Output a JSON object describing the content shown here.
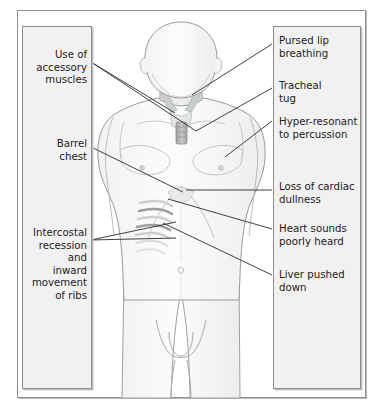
{
  "figure": {
    "frame_color": "#8e8e8e",
    "panel_fill": "#f1f1f1",
    "panel_border": "#8a8a8a",
    "leader_line_color": "#2b2b2b",
    "body_outline_color": "#9a9a9a",
    "body_fill": "#fbfbfb"
  },
  "left_panel": {
    "align": "right",
    "labels": [
      {
        "id": "accessory-muscles",
        "text": "Use of\naccessory\nmuscles",
        "top": 48,
        "lines": 3
      },
      {
        "id": "barrel-chest",
        "text": "Barrel\nchest",
        "top": 137,
        "lines": 2
      },
      {
        "id": "intercostal-recession",
        "text": "Intercostal\nrecession\nand\ninward\nmovement\nof ribs",
        "top": 226,
        "lines": 6
      }
    ]
  },
  "right_panel": {
    "align": "left",
    "labels": [
      {
        "id": "pursed-lip-breathing",
        "text": "Pursed lip\nbreathing",
        "top": 34,
        "lines": 2
      },
      {
        "id": "tracheal-tug",
        "text": "Tracheal\ntug",
        "top": 79,
        "lines": 2
      },
      {
        "id": "hyper-resonant",
        "text": "Hyper-resonant\nto percussion",
        "top": 115,
        "lines": 2
      },
      {
        "id": "loss-cardiac-dullness",
        "text": "Loss of cardiac\ndullness",
        "top": 180,
        "lines": 2
      },
      {
        "id": "heart-sounds",
        "text": "Heart sounds\npoorly heard",
        "top": 222,
        "lines": 2
      },
      {
        "id": "liver-pushed-down",
        "text": "Liver pushed\ndown",
        "top": 268,
        "lines": 2
      }
    ]
  },
  "leaders": {
    "accessory_muscles_a": {
      "from": [
        91,
        62
      ],
      "to": [
        175,
        113
      ]
    },
    "accessory_muscles_b": {
      "from": [
        91,
        62
      ],
      "to": [
        196,
        131
      ]
    },
    "barrel_chest": {
      "from": [
        91,
        147
      ],
      "to": [
        183,
        192
      ]
    },
    "intercostal_a": {
      "from": [
        91,
        240
      ],
      "to": [
        176,
        222
      ]
    },
    "intercostal_b": {
      "from": [
        91,
        240
      ],
      "to": [
        176,
        238
      ]
    },
    "pursed_lip": {
      "from": [
        272,
        44
      ],
      "to": [
        192,
        95
      ]
    },
    "tracheal_tug": {
      "from": [
        272,
        88
      ],
      "to": [
        196,
        131
      ]
    },
    "hyper_resonant": {
      "from": [
        272,
        121
      ],
      "to": [
        225,
        157
      ]
    },
    "loss_cardiac": {
      "from": [
        272,
        190
      ],
      "to": [
        186,
        190
      ]
    },
    "heart_sounds": {
      "from": [
        272,
        229
      ],
      "to": [
        168,
        199
      ]
    },
    "liver_pushed": {
      "from": [
        272,
        275
      ],
      "to": [
        163,
        223
      ]
    }
  }
}
